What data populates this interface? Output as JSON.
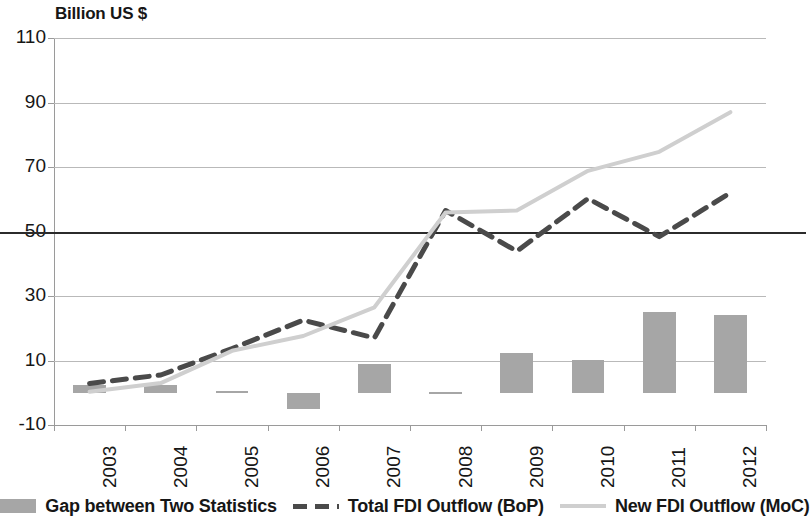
{
  "chart_data": {
    "type": "line",
    "title": "",
    "subtitle": "",
    "axis_title": "Billion US $",
    "xlabel": "",
    "ylabel": "Billion US $",
    "categories": [
      "2003",
      "2004",
      "2005",
      "2006",
      "2007",
      "2008",
      "2009",
      "2010",
      "2011",
      "2012"
    ],
    "ylim": [
      -10,
      110
    ],
    "yticks": [
      -10,
      10,
      30,
      50,
      70,
      90,
      110
    ],
    "ytick_labels": [
      "-10",
      "10",
      "30",
      "50",
      "70",
      "90",
      "110"
    ],
    "grid": true,
    "legend_position": "bottom",
    "series": [
      {
        "name": "Gap between Two Statistics",
        "type": "bar",
        "color": "#a6a6a6",
        "values": [
          2.5,
          2.5,
          0.5,
          -5.0,
          9.0,
          0.3,
          12.3,
          10.2,
          25.0,
          24.0
        ]
      },
      {
        "name": "Total FDI Outflow (BoP)",
        "type": "line",
        "style": "dashed",
        "color": "#4a4a4a",
        "values": [
          2.9,
          5.5,
          13.7,
          22.5,
          17.0,
          56.5,
          43.9,
          60.2,
          48.4,
          62.0
        ]
      },
      {
        "name": "New FDI Outflow (MoC)",
        "type": "line",
        "style": "solid",
        "color": "#cfcfcf",
        "values": [
          0.3,
          3.0,
          13.0,
          17.6,
          26.5,
          55.9,
          56.5,
          68.8,
          74.7,
          87.0
        ]
      }
    ]
  },
  "legend": {
    "items": [
      {
        "label": "Gap between Two Statistics",
        "marker": "bar-swatch",
        "color": "#a6a6a6"
      },
      {
        "label": "Total FDI Outflow (BoP)",
        "marker": "dashed-line-swatch",
        "color": "#4a4a4a"
      },
      {
        "label": "New FDI Outflow (MoC)",
        "marker": "solid-line-swatch",
        "color": "#cfcfcf"
      }
    ]
  }
}
